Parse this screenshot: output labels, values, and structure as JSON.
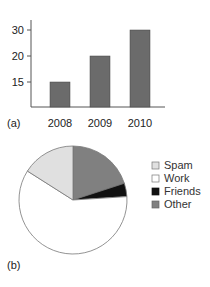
{
  "chart_data": [
    {
      "type": "bar",
      "panel_label": "(a)",
      "categories": [
        "2008",
        "2009",
        "2010"
      ],
      "values": [
        15,
        20,
        30
      ],
      "title": "",
      "xlabel": "",
      "ylabel": "",
      "yticks": [
        "30",
        "20",
        "15"
      ],
      "ylim": [
        10,
        30
      ],
      "grid": false,
      "bar_color": "#6b6b6b"
    },
    {
      "type": "pie",
      "panel_label": "(b)",
      "labels": [
        "Other",
        "Friends",
        "Work",
        "Spam"
      ],
      "values": [
        20,
        4,
        60,
        16
      ],
      "colors": [
        "#808080",
        "#111111",
        "#ffffff",
        "#e0e0e0"
      ],
      "legend": [
        "Spam",
        "Work",
        "Friends",
        "Other"
      ],
      "legend_colors": [
        "#e0e0e0",
        "#ffffff",
        "#111111",
        "#808080"
      ],
      "legend_position": "right",
      "start_angle": "12 o'clock, clockwise"
    }
  ]
}
